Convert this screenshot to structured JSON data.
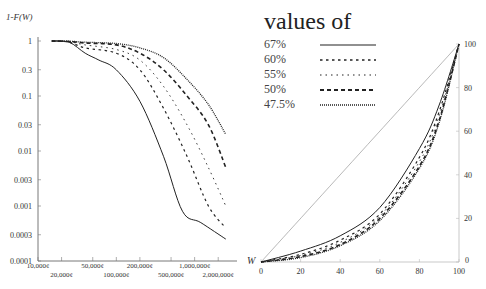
{
  "legend": {
    "title": "values of",
    "entries": [
      {
        "label": "67%",
        "style": "solid"
      },
      {
        "label": "60%",
        "style": "dashed-short"
      },
      {
        "label": "55%",
        "style": "dashed-fine"
      },
      {
        "label": "50%",
        "style": "dashed-long"
      },
      {
        "label": "47.5%",
        "style": "dotted"
      }
    ]
  },
  "chart_data": [
    {
      "type": "line",
      "title": "",
      "xlabel": "W",
      "ylabel": "1-F(W)",
      "xscale": "log",
      "yscale": "log",
      "x_ticks": [
        "10,000¢",
        "20,000¢",
        "50,000¢",
        "100,000¢",
        "200,000¢",
        "500,000¢",
        "1,000,000¢",
        "2,000,000¢"
      ],
      "y_ticks": [
        "1",
        "0.3",
        "0.1",
        "0.03",
        "0.01",
        "0.003",
        "0.001",
        "0.0003",
        "0.0001"
      ],
      "xlim": [
        10000,
        3000000
      ],
      "ylim": [
        0.0001,
        1
      ],
      "grid": false,
      "series": [
        {
          "name": "67%",
          "x": [
            15000,
            25000,
            40000,
            60000,
            100000,
            200000,
            400000,
            700000,
            1200000,
            2500000
          ],
          "y": [
            1,
            0.95,
            0.6,
            0.45,
            0.3,
            0.08,
            0.008,
            0.0008,
            0.0005,
            0.00025
          ]
        },
        {
          "name": "60%",
          "x": [
            15000,
            25000,
            40000,
            100000,
            200000,
            400000,
            800000,
            1500000,
            2500000
          ],
          "y": [
            1,
            0.95,
            0.75,
            0.6,
            0.3,
            0.06,
            0.008,
            0.001,
            0.0004
          ]
        },
        {
          "name": "55%",
          "x": [
            15000,
            25000,
            40000,
            100000,
            200000,
            400000,
            800000,
            1500000,
            2500000
          ],
          "y": [
            1,
            0.97,
            0.85,
            0.7,
            0.45,
            0.15,
            0.03,
            0.005,
            0.001
          ]
        },
        {
          "name": "50%",
          "x": [
            15000,
            25000,
            40000,
            100000,
            200000,
            400000,
            800000,
            1500000,
            2500000
          ],
          "y": [
            1,
            0.98,
            0.92,
            0.85,
            0.6,
            0.3,
            0.1,
            0.03,
            0.005
          ]
        },
        {
          "name": "47.5%",
          "x": [
            15000,
            25000,
            40000,
            100000,
            200000,
            400000,
            800000,
            1500000,
            2500000
          ],
          "y": [
            1,
            0.99,
            0.95,
            0.9,
            0.75,
            0.5,
            0.2,
            0.07,
            0.02
          ]
        }
      ]
    },
    {
      "type": "line",
      "title": "",
      "xlabel": "",
      "ylabel": "",
      "xlim": [
        0,
        100
      ],
      "ylim": [
        0,
        100
      ],
      "x_ticks": [
        "0",
        "20",
        "40",
        "60",
        "80",
        "100"
      ],
      "y_ticks": [
        "0",
        "20",
        "40",
        "60",
        "80",
        "100"
      ],
      "y_axis_position": "right",
      "grid": false,
      "series": [
        {
          "name": "equality line",
          "x": [
            0,
            100
          ],
          "y": [
            0,
            100
          ]
        },
        {
          "name": "67%",
          "x": [
            0,
            20,
            40,
            60,
            80,
            90,
            100
          ],
          "y": [
            0,
            5,
            12,
            25,
            52,
            72,
            100
          ]
        },
        {
          "name": "60%",
          "x": [
            0,
            20,
            40,
            60,
            80,
            90,
            100
          ],
          "y": [
            0,
            3.5,
            10,
            22,
            48,
            69,
            100
          ]
        },
        {
          "name": "55%",
          "x": [
            0,
            20,
            40,
            60,
            80,
            90,
            100
          ],
          "y": [
            0,
            3,
            9,
            21,
            46,
            67,
            100
          ]
        },
        {
          "name": "50%",
          "x": [
            0,
            20,
            40,
            60,
            80,
            90,
            100
          ],
          "y": [
            0,
            2.5,
            8,
            20,
            44,
            65,
            100
          ]
        },
        {
          "name": "47.5%",
          "x": [
            0,
            20,
            40,
            60,
            80,
            90,
            100
          ],
          "y": [
            0,
            2,
            7.5,
            19,
            43,
            64,
            100
          ]
        }
      ]
    }
  ]
}
